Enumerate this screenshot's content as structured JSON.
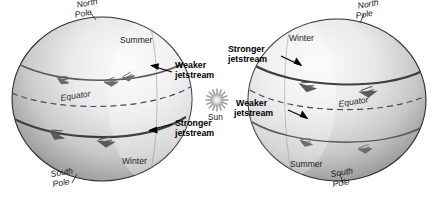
{
  "diagram": {
    "type": "science-illustration",
    "background_color": "#ffffff",
    "globe_fill_light": "#f2f2f2",
    "globe_fill_dark": "#8c8c8c",
    "line_color": "#4d4d4d"
  },
  "sun": {
    "label": "Sun",
    "icon": "sun-icon",
    "color": "#9a9a9a"
  },
  "left_globe": {
    "name": "left-globe",
    "caption": "Northern hemisphere summer",
    "labels": {
      "north_pole": "North\nPole",
      "north_pole_line1": "North",
      "north_pole_line2": "Pole",
      "south_pole_line1": "South",
      "south_pole_line2": "Pole",
      "equator": "Equator",
      "upper_season": "Summer",
      "lower_season": "Winter"
    },
    "callouts": [
      {
        "name": "weaker-jetstream-callout",
        "line1": "Weaker",
        "line2": "jetstream",
        "arrow_direction": "left",
        "hemisphere": "northern"
      },
      {
        "name": "stronger-jetstream-callout",
        "line1": "Stronger",
        "line2": "jetstream",
        "arrow_direction": "left",
        "hemisphere": "southern"
      }
    ]
  },
  "right_globe": {
    "name": "right-globe",
    "caption": "Northern hemisphere winter",
    "labels": {
      "north_pole_line1": "North",
      "north_pole_line2": "Pole",
      "south_pole_line1": "South",
      "south_pole_line2": "Pole",
      "equator": "Equator",
      "upper_season": "Winter",
      "lower_season": "Summer"
    },
    "callouts": [
      {
        "name": "stronger-jetstream-callout",
        "line1": "Stronger",
        "line2": "jetstream",
        "arrow_direction": "right",
        "hemisphere": "northern"
      },
      {
        "name": "weaker-jetstream-callout",
        "line1": "Weaker",
        "line2": "jetstream",
        "arrow_direction": "right",
        "hemisphere": "southern"
      }
    ]
  }
}
